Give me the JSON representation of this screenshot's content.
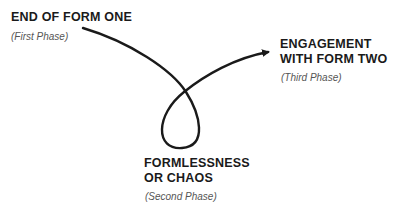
{
  "diagram": {
    "nodes": [
      {
        "id": "phase1",
        "title_lines": [
          "END OF FORM ONE"
        ],
        "subtitle": "(First Phase)"
      },
      {
        "id": "phase2",
        "title_lines": [
          "FORMLESSNESS",
          "OR CHAOS"
        ],
        "subtitle": "(Second Phase)"
      },
      {
        "id": "phase3",
        "title_lines": [
          "ENGAGEMENT",
          "WITH FORM TWO"
        ],
        "subtitle": "(Third Phase)"
      }
    ],
    "edges": [
      {
        "from": "phase1",
        "to": "phase2",
        "style": "curved line"
      },
      {
        "from": "phase2",
        "to": "phase3",
        "style": "curved arrow"
      }
    ],
    "colors": {
      "stroke": "#1a1a1a",
      "title": "#1a1a1a",
      "subtitle": "#555555",
      "background": "#ffffff"
    }
  }
}
